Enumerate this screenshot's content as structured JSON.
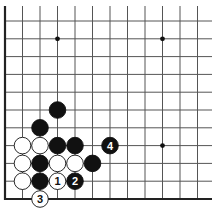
{
  "board": {
    "origin_x": 5,
    "origin_y": 21,
    "spacing_x": 17.5,
    "spacing_y": 17.8,
    "cols": 12,
    "rows": 11,
    "edges": [
      "left",
      "bottom"
    ],
    "star_points": [
      [
        3,
        1
      ],
      [
        9,
        1
      ],
      [
        9,
        7
      ]
    ]
  },
  "colors": {
    "line": "#555555",
    "edge": "#222222",
    "black": "#111111",
    "white": "#ffffff"
  },
  "stones": [
    {
      "color": "black",
      "col": 3,
      "row": 5,
      "label": ""
    },
    {
      "color": "black",
      "col": 2,
      "row": 6,
      "label": ""
    },
    {
      "color": "white",
      "col": 1,
      "row": 7,
      "label": ""
    },
    {
      "color": "white",
      "col": 2,
      "row": 7,
      "label": ""
    },
    {
      "color": "black",
      "col": 3,
      "row": 7,
      "label": ""
    },
    {
      "color": "black",
      "col": 4,
      "row": 7,
      "label": ""
    },
    {
      "color": "black",
      "col": 6,
      "row": 7,
      "label": "4"
    },
    {
      "color": "white",
      "col": 1,
      "row": 8,
      "label": ""
    },
    {
      "color": "black",
      "col": 2,
      "row": 8,
      "label": ""
    },
    {
      "color": "white",
      "col": 3,
      "row": 8,
      "label": ""
    },
    {
      "color": "white",
      "col": 4,
      "row": 8,
      "label": ""
    },
    {
      "color": "black",
      "col": 5,
      "row": 8,
      "label": ""
    },
    {
      "color": "white",
      "col": 1,
      "row": 9,
      "label": ""
    },
    {
      "color": "black",
      "col": 2,
      "row": 9,
      "label": ""
    },
    {
      "color": "white",
      "col": 3,
      "row": 9,
      "label": "1"
    },
    {
      "color": "black",
      "col": 4,
      "row": 9,
      "label": "2"
    },
    {
      "color": "white",
      "col": 2,
      "row": 10,
      "label": "3"
    }
  ]
}
